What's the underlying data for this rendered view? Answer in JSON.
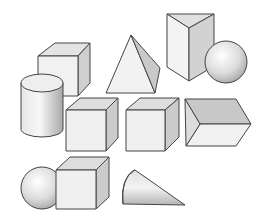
{
  "figure": {
    "background": "#ffffff",
    "colors": {
      "face_light": "#f2f2f2",
      "face_mid": "#e2e2e2",
      "face_dark": "#c8c8c8",
      "edge": "#444444"
    },
    "shapes": [
      {
        "id": "cube-top-left",
        "type": "cube"
      },
      {
        "id": "pyramid",
        "type": "pyramid"
      },
      {
        "id": "triangular-prism",
        "type": "triangular-prism"
      },
      {
        "id": "sphere-top-right",
        "type": "sphere"
      },
      {
        "id": "cylinder",
        "type": "cylinder"
      },
      {
        "id": "cube-middle-left",
        "type": "cube"
      },
      {
        "id": "cube-middle-right",
        "type": "cube"
      },
      {
        "id": "hexagonal-prism",
        "type": "prism"
      },
      {
        "id": "sphere-bottom-left",
        "type": "sphere"
      },
      {
        "id": "cube-bottom",
        "type": "cube"
      },
      {
        "id": "cone",
        "type": "cone"
      }
    ]
  }
}
